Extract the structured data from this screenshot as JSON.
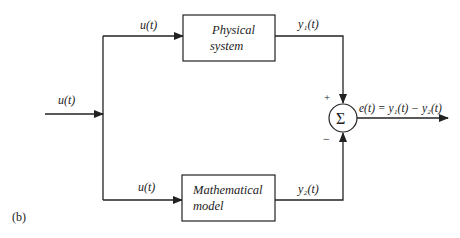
{
  "diagram": {
    "panel_label": "(b)",
    "input_signal": "u(t)",
    "top_branch_signal": "u(t)",
    "bottom_branch_signal": "u(t)",
    "blocks": [
      {
        "id": "physical",
        "line1": "Physical",
        "line2": "system",
        "output": "y₁(t)"
      },
      {
        "id": "model",
        "line1": "Mathematical",
        "line2": "model",
        "output": "y₂(t)"
      }
    ],
    "summing_junction": {
      "symbol": "Σ",
      "plus_sign": "+",
      "minus_sign": "−"
    },
    "output_signal": "e(t) = y₁(t) − y₂(t)",
    "colors": {
      "stroke": "#222222",
      "background": "#ffffff"
    }
  }
}
